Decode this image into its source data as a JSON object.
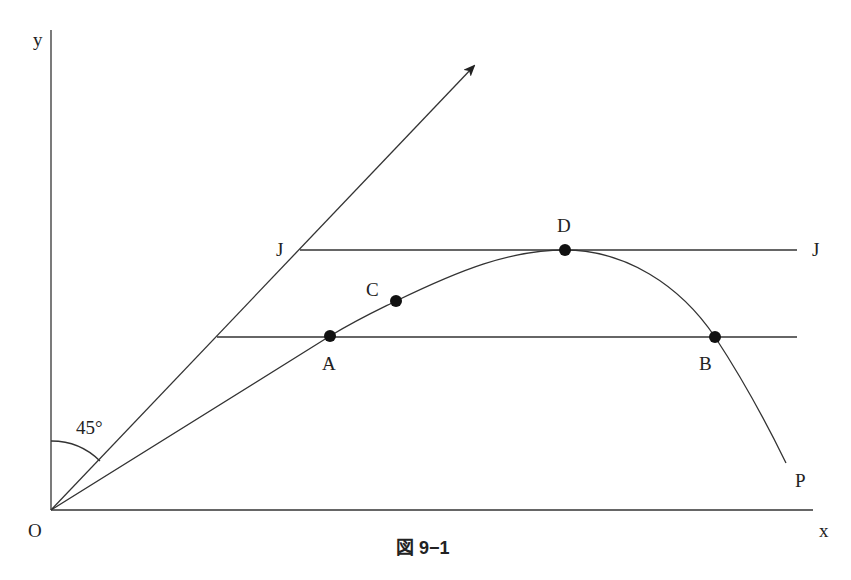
{
  "figure": {
    "caption": "図 9−1",
    "axes": {
      "origin_label": "O",
      "x_label": "x",
      "y_label": "y"
    },
    "angle_label": "45°",
    "lines": {
      "ray_45": {
        "from": "O",
        "direction": "45° line with arrow"
      },
      "upper_horizontal": {
        "left_label": "J",
        "right_label": "J"
      },
      "lower_horizontal": {
        "passes_through": [
          "A",
          "B"
        ]
      }
    },
    "curve": {
      "end_label": "P",
      "points": [
        {
          "label": "A",
          "x": 330,
          "y": 336
        },
        {
          "label": "C",
          "x": 396,
          "y": 301
        },
        {
          "label": "D",
          "x": 565,
          "y": 250
        },
        {
          "label": "B",
          "x": 715,
          "y": 337
        }
      ]
    }
  }
}
